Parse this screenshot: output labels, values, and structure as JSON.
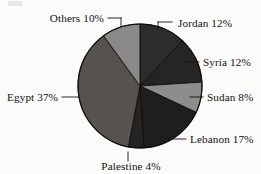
{
  "chart_data": {
    "type": "pie",
    "title": "",
    "subtitle": "",
    "xlabel": "",
    "ylabel": "",
    "legend_position": "none",
    "grid": false,
    "label_format": "{name} {value}%",
    "start_angle_deg": 0,
    "direction": "clockwise",
    "categories": [
      "Jordan",
      "Syria",
      "Sudan",
      "Lebanon",
      "Palestine",
      "Egypt",
      "Others"
    ],
    "values": [
      12,
      12,
      8,
      17,
      4,
      37,
      10
    ],
    "labels": [
      "Jordan 12%",
      "Syria 12%",
      "Sudan 8%",
      "Lebanon 17%",
      "Palestine 4%",
      "Egypt 37%",
      "Others 10%"
    ],
    "slices": [
      {
        "name": "Jordan",
        "value": 12,
        "label": "Jordan 12%",
        "color": "#2e2c2a",
        "label_anchor": "start",
        "label_x": 178,
        "label_y": 27,
        "leader": [
          [
            158,
            22
          ],
          [
            172,
            22
          ]
        ],
        "leader_elbow": [
          [
            158,
            22
          ],
          [
            158,
            29
          ]
        ]
      },
      {
        "name": "Syria",
        "value": 12,
        "label": "Syria 12%",
        "color": "#272523",
        "label_anchor": "start",
        "label_x": 203,
        "label_y": 66,
        "leader": [
          [
            186,
            62
          ],
          [
            199,
            62
          ]
        ]
      },
      {
        "name": "Sudan",
        "value": 8,
        "label": "Sudan 8%",
        "color": "#8d8d8c",
        "label_anchor": "start",
        "label_x": 207,
        "label_y": 101,
        "leader": [
          [
            190,
            97
          ],
          [
            203,
            97
          ]
        ]
      },
      {
        "name": "Lebanon",
        "value": 17,
        "label": "Lebanon 17%",
        "color": "#201e1d",
        "label_anchor": "start",
        "label_x": 190,
        "label_y": 143,
        "leader": [
          [
            172,
            139
          ],
          [
            186,
            139
          ]
        ]
      },
      {
        "name": "Palestine",
        "value": 4,
        "label": "Palestine 4%",
        "color": "#262422",
        "label_anchor": "middle",
        "label_x": 131,
        "label_y": 170,
        "leader": [
          [
            128,
            152
          ],
          [
            128,
            161
          ]
        ]
      },
      {
        "name": "Egypt",
        "value": 37,
        "label": "Egypt 37%",
        "color": "#56534f",
        "label_anchor": "end",
        "label_x": 58,
        "label_y": 101,
        "leader": [
          [
            62,
            97
          ],
          [
            78,
            97
          ]
        ]
      },
      {
        "name": "Others",
        "value": 10,
        "label": "Others 10%",
        "color": "#8a8987",
        "label_anchor": "end",
        "label_x": 104,
        "label_y": 22,
        "leader": [
          [
            108,
            18
          ],
          [
            121,
            18
          ]
        ],
        "leader_elbow": [
          [
            121,
            18
          ],
          [
            121,
            26
          ]
        ]
      }
    ],
    "geometry": {
      "cx": 140,
      "cy": 86,
      "r": 62
    },
    "colors": {
      "Jordan": "#2e2c2a",
      "Syria": "#272523",
      "Sudan": "#8d8d8c",
      "Lebanon": "#201e1d",
      "Palestine": "#262422",
      "Egypt": "#56534f",
      "Others": "#8a8987",
      "outline": "#0d0c0b",
      "background": "#fbfbfa",
      "text": "#14110f"
    }
  }
}
